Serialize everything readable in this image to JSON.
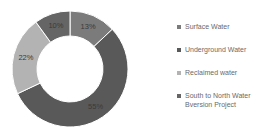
{
  "chart_data": {
    "type": "pie",
    "subtype": "donut",
    "title": "",
    "categories": [
      "Surface Water",
      "Underground Water",
      "Reclaimed water",
      "South to North Water Bversion Project"
    ],
    "values": [
      13,
      55,
      22,
      10
    ],
    "labels": [
      "13%",
      "55%",
      "22%",
      "10%"
    ],
    "colors": [
      "#7b7b7b",
      "#595959",
      "#b3b3b3",
      "#656565"
    ],
    "start_angle": "12 o'clock",
    "direction": "clockwise",
    "legend_position": "right"
  },
  "legend": {
    "items": [
      {
        "label": "Surface Water",
        "color": "#7b7b7b"
      },
      {
        "label": "Underground Water",
        "color": "#595959"
      },
      {
        "label": "Reclaimed water",
        "color": "#b3b3b3"
      },
      {
        "label": "South to North Water Bversion Project",
        "color": "#656565"
      }
    ]
  }
}
